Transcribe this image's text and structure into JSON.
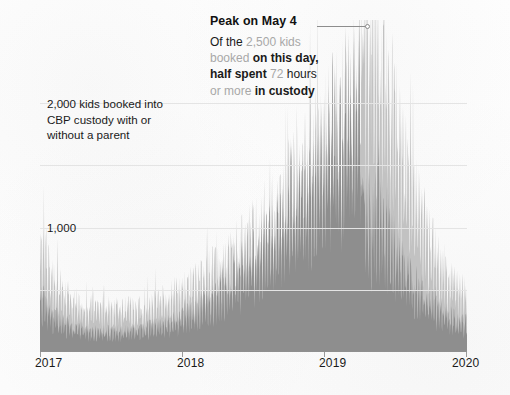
{
  "figure": {
    "background_color": "#fdfdfd",
    "annotation_left": "2,000 kids booked into CBP custody with or without a parent",
    "annotation_left_lines": [
      "2,000 kids booked into",
      "CBP custody with or",
      "without a parent"
    ],
    "callout": {
      "title": "Peak on May 4",
      "body_plain": "Of the 2,500 kids booked on this day, half spent 72 hours or more in custody",
      "line1": {
        "dark1": "Of the ",
        "gray1": "2,500 kids"
      },
      "line2": {
        "gray1": "booked ",
        "dark1": "on this day,"
      },
      "line3": {
        "dark1": "half spent ",
        "gray1": "72 ",
        "dark2": "hours"
      },
      "line4": {
        "gray1": "or more ",
        "dark1": "in custody"
      },
      "leader_dot": "peak-marker"
    }
  },
  "chart_data": {
    "type": "area",
    "title": "",
    "subtitle": "",
    "xlabel": "",
    "ylabel": "kids booked into CBP custody",
    "xlim": [
      "2017",
      "2020"
    ],
    "ylim": [
      0,
      2600
    ],
    "grid": true,
    "gridlines_y": [
      500,
      1000,
      1500,
      2000
    ],
    "y_tick_labels": [
      {
        "value": 2000,
        "label": "2,000",
        "rendered_in_annotation": true
      },
      {
        "value": 1000,
        "label": "1,000",
        "rendered_in_annotation": false
      }
    ],
    "x_tick_labels": [
      "2017",
      "2018",
      "2019",
      "2020"
    ],
    "legend_position": "none",
    "peak": {
      "date": "May 4",
      "year": 2019,
      "value": 2500,
      "median_hours_in_custody": 72
    },
    "series": [
      {
        "name": "All kids booked into CBP custody",
        "color": "#c2c2c2",
        "values": [
          980,
          930,
          880,
          830,
          780,
          740,
          700,
          660,
          620,
          590,
          560,
          540,
          520,
          500,
          485,
          470,
          455,
          445,
          435,
          425,
          415,
          408,
          400,
          395,
          390,
          385,
          380,
          378,
          375,
          372,
          370,
          368,
          366,
          364,
          362,
          360,
          358,
          356,
          355,
          354,
          353,
          352,
          352,
          351,
          351,
          350,
          350,
          351,
          352,
          353,
          354,
          356,
          358,
          360,
          362,
          365,
          368,
          371,
          374,
          378,
          382,
          386,
          390,
          395,
          400,
          405,
          410,
          416,
          422,
          428,
          434,
          440,
          447,
          454,
          461,
          468,
          475,
          483,
          491,
          499,
          507,
          515,
          523,
          532,
          541,
          550,
          559,
          568,
          578,
          588,
          598,
          608,
          618,
          629,
          640,
          651,
          662,
          673,
          685,
          697,
          709,
          721,
          733,
          746,
          759,
          772,
          785,
          798,
          812,
          826,
          840,
          854,
          868,
          883,
          898,
          913,
          928,
          943,
          959,
          975,
          991,
          1007,
          1023,
          1040,
          1057,
          1074,
          1091,
          1108,
          1126,
          1144,
          1162,
          1180,
          1198,
          1217,
          1236,
          1255,
          1274,
          1293,
          1313,
          1333,
          1353,
          1373,
          1393,
          1414,
          1435,
          1456,
          1477,
          1498,
          1520,
          1542,
          1564,
          1586,
          1608,
          1631,
          1654,
          1677,
          1700,
          1723,
          1747,
          1771,
          1795,
          1819,
          1843,
          1868,
          1893,
          1918,
          1943,
          1968,
          1994,
          2020,
          2046,
          2072,
          2098,
          2125,
          2152,
          2179,
          2206,
          2234,
          2262,
          2290,
          2318,
          2347,
          2376,
          2405,
          2434,
          2464,
          2494,
          2500,
          2470,
          2440,
          2400,
          2350,
          2300,
          2250,
          2190,
          2130,
          2070,
          2010,
          1950,
          1890,
          1830,
          1770,
          1710,
          1650,
          1595,
          1540,
          1485,
          1430,
          1380,
          1330,
          1280,
          1230,
          1185,
          1140,
          1095,
          1050,
          1010,
          970,
          930,
          895,
          860,
          825,
          795,
          765,
          735,
          710,
          685,
          660,
          640,
          620,
          600,
          585,
          570,
          555,
          545,
          535,
          525,
          518,
          511,
          505
        ]
      },
      {
        "name": "Kids who spent 72 hours or more in custody",
        "color": "#8e8e8e",
        "values": [
          480,
          455,
          430,
          405,
          385,
          365,
          345,
          325,
          310,
          295,
          280,
          268,
          258,
          248,
          240,
          232,
          225,
          219,
          214,
          209,
          204,
          200,
          196,
          193,
          190,
          188,
          186,
          184,
          182,
          180,
          179,
          178,
          177,
          176,
          175,
          174,
          173,
          173,
          172,
          172,
          172,
          172,
          172,
          172,
          173,
          173,
          174,
          175,
          176,
          177,
          178,
          180,
          182,
          184,
          186,
          188,
          190,
          192,
          195,
          198,
          201,
          204,
          207,
          211,
          215,
          219,
          223,
          227,
          232,
          237,
          242,
          247,
          252,
          258,
          264,
          270,
          276,
          283,
          290,
          297,
          304,
          312,
          320,
          328,
          336,
          345,
          354,
          363,
          373,
          383,
          393,
          403,
          414,
          425,
          436,
          448,
          460,
          472,
          485,
          498,
          511,
          525,
          539,
          553,
          568,
          583,
          598,
          614,
          630,
          646,
          663,
          680,
          697,
          715,
          733,
          751,
          770,
          789,
          808,
          828,
          848,
          868,
          889,
          910,
          931,
          953,
          975,
          997,
          1020,
          1043,
          1066,
          1090,
          1114,
          1138,
          1163,
          1188,
          1213,
          1239,
          1265,
          1291,
          1318,
          1345,
          1372,
          1400,
          1428,
          1456,
          1485,
          1514,
          1543,
          1573,
          1603,
          1633,
          1664,
          1695,
          1726,
          1758,
          1790,
          1822,
          1855,
          1888,
          1921,
          1955,
          1989,
          2023,
          2058,
          2093,
          2128,
          2164,
          2200,
          2236,
          2273,
          2310,
          2347,
          2385,
          2423,
          2461,
          2500,
          2539,
          2578,
          2618,
          1250,
          1230,
          1210,
          1190,
          1170,
          1150,
          1130,
          1250,
          1230,
          1205,
          1180,
          1150,
          1120,
          1090,
          1055,
          1020,
          985,
          950,
          915,
          880,
          845,
          812,
          780,
          750,
          720,
          692,
          665,
          640,
          616,
          593,
          570,
          548,
          528,
          508,
          490,
          472,
          456,
          440,
          425,
          411,
          397,
          384,
          371,
          359,
          348,
          337,
          327,
          317,
          308,
          299,
          291,
          283,
          276,
          269,
          263,
          257,
          252,
          247,
          243,
          239
        ]
      }
    ],
    "note": "Dense daily time series, Jan 2017 through early 2020. Light gray = total kids booked; dark gray overlay = kids whose stay exceeded 72 hours."
  }
}
